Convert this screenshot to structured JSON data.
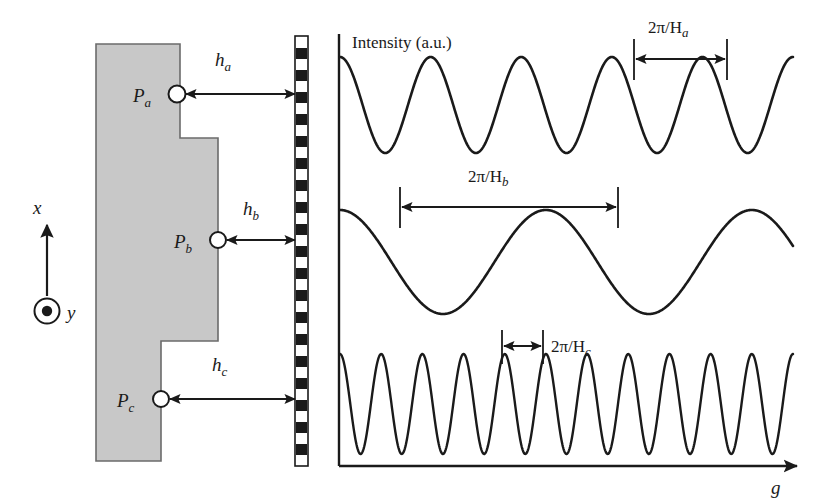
{
  "figure": {
    "title_text": "",
    "background_color": "#ffffff",
    "stroke_color": "#1a1a1a",
    "sample_fill_color": "#c8c8c8",
    "sample_edge_color": "#6b6b6b"
  },
  "left_panel": {
    "name": "stepped-sample-schematic",
    "coordinate_system": {
      "x_axis_label": "x",
      "y_axis_label": "y",
      "y_symbol": "out-of-plane-dot"
    },
    "points": [
      {
        "id": "Pa",
        "label": "P",
        "subscript": "a"
      },
      {
        "id": "Pb",
        "label": "P",
        "subscript": "b"
      },
      {
        "id": "Pc",
        "label": "P",
        "subscript": "c"
      }
    ],
    "gap_labels": [
      {
        "id": "ha",
        "label": "h",
        "subscript": "a"
      },
      {
        "id": "hb",
        "label": "h",
        "subscript": "b"
      },
      {
        "id": "hc",
        "label": "h",
        "subscript": "c"
      }
    ],
    "detector": {
      "name": "checkered-detector-bar",
      "pattern": "alternating-black-white-squares"
    }
  },
  "right_panel": {
    "name": "intensity-oscillation-plot",
    "y_axis_caption": "Intensity (a.u.)",
    "x_axis_caption": "g",
    "period_labels": [
      {
        "id": "period_a",
        "text": "2π/H",
        "subscript": "a"
      },
      {
        "id": "period_b",
        "text": "2π/H",
        "subscript": "b"
      },
      {
        "id": "period_c",
        "text": "2π/H",
        "subscript": "c"
      }
    ]
  },
  "chart_data": {
    "type": "line",
    "title": "",
    "xlabel": "g",
    "ylabel": "Intensity (a.u.)",
    "grid": false,
    "legend": false,
    "x_range": [
      0,
      10
    ],
    "series": [
      {
        "name": "Pa oscillation",
        "description": "Intensity oscillation measured at point Pa with gap ha",
        "waveform": "cosine",
        "periods_shown": 5.0,
        "period_in_x_units": 2.0,
        "period_label": "2π/Ha",
        "amplitude": 1.0,
        "phase_deg": 0,
        "baseline_y": 1.0
      },
      {
        "name": "Pb oscillation",
        "description": "Intensity oscillation measured at point Pb with gap hb",
        "waveform": "cosine",
        "periods_shown": 2.2,
        "period_in_x_units": 4.55,
        "period_label": "2π/Hb",
        "amplitude": 1.0,
        "phase_deg": 0,
        "baseline_y": 0.0
      },
      {
        "name": "Pc oscillation",
        "description": "Intensity oscillation measured at point Pc with gap hc",
        "waveform": "cosine",
        "periods_shown": 11.0,
        "period_in_x_units": 0.909,
        "period_label": "2π/Hc",
        "amplitude": 1.0,
        "phase_deg": 0,
        "baseline_y": -1.0
      }
    ],
    "annotations": [
      {
        "text": "2π/Ha",
        "refers_to": "Pa oscillation",
        "kind": "period-span"
      },
      {
        "text": "2π/Hb",
        "refers_to": "Pb oscillation",
        "kind": "period-span"
      },
      {
        "text": "2π/Hc",
        "refers_to": "Pc oscillation",
        "kind": "period-span"
      }
    ],
    "relationship": "Larger gap h yields shorter oscillation period 2π/H; hb < ha < hc corresponds to periods 2π/Hc < 2π/Ha < 2π/Hb"
  }
}
